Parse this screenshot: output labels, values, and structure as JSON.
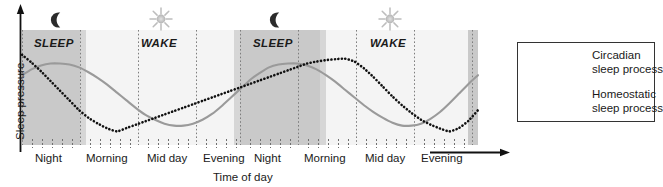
{
  "chart_data": {
    "type": "line",
    "title": "",
    "xlabel": "Time of day",
    "ylabel": "Sleep pressure",
    "grid": true,
    "legend_position": "right",
    "xlim": [
      0,
      48
    ],
    "ylim": [
      0,
      1
    ],
    "x_tick_labels": [
      "Night",
      "Morning",
      "Mid day",
      "Evening",
      "Night",
      "Morning",
      "Mid day",
      "Evening"
    ],
    "y_tick_labels": [],
    "annotations": [
      "SLEEP",
      "WAKE",
      "SLEEP",
      "WAKE"
    ],
    "shaded_regions": [
      {
        "label": "SLEEP",
        "x0": 0,
        "x1": 6,
        "color": "#c9c9c9"
      },
      {
        "label": "WAKE",
        "x0": 6,
        "x1": 24,
        "color": "#f2f2f2"
      },
      {
        "label": "SLEEP",
        "x0": 24,
        "x1": 30,
        "color": "#c9c9c9"
      },
      {
        "label": "WAKE",
        "x0": 30,
        "x1": 48,
        "color": "#f2f2f2"
      }
    ],
    "series": [
      {
        "name": "Circadian sleep process",
        "style": "solid",
        "color": "#9a9a9a",
        "x": [
          0,
          1,
          2,
          3,
          4,
          5,
          6,
          7,
          8,
          9,
          10,
          11,
          12,
          13,
          14,
          15,
          16,
          17,
          18,
          19,
          20,
          21,
          22,
          23,
          24,
          25,
          26,
          27,
          28,
          29,
          30,
          31,
          32,
          33,
          34,
          35,
          36,
          37,
          38,
          39,
          40,
          41,
          42,
          43,
          44,
          45,
          46,
          47,
          48
        ],
        "y": [
          0.72,
          0.78,
          0.82,
          0.84,
          0.84,
          0.83,
          0.8,
          0.75,
          0.69,
          0.62,
          0.54,
          0.46,
          0.38,
          0.31,
          0.26,
          0.22,
          0.2,
          0.2,
          0.22,
          0.26,
          0.32,
          0.4,
          0.49,
          0.58,
          0.67,
          0.74,
          0.8,
          0.83,
          0.84,
          0.84,
          0.82,
          0.78,
          0.72,
          0.65,
          0.57,
          0.49,
          0.41,
          0.34,
          0.28,
          0.23,
          0.2,
          0.2,
          0.22,
          0.27,
          0.34,
          0.43,
          0.53,
          0.63,
          0.72
        ]
      },
      {
        "name": "Homeostatic sleep process",
        "style": "dotted",
        "color": "#111111",
        "x": [
          0,
          1,
          2,
          3,
          4,
          5,
          6,
          7,
          8,
          9,
          10,
          11,
          12,
          13,
          14,
          15,
          16,
          17,
          18,
          19,
          20,
          21,
          22,
          23,
          24,
          25,
          26,
          27,
          28,
          29,
          30,
          31,
          32,
          33,
          34,
          35,
          36,
          37,
          38,
          39,
          40,
          41,
          42,
          43,
          44,
          45,
          46,
          47,
          48
        ],
        "y": [
          0.93,
          0.85,
          0.76,
          0.66,
          0.56,
          0.46,
          0.36,
          0.28,
          0.22,
          0.17,
          0.14,
          0.175,
          0.21,
          0.245,
          0.28,
          0.315,
          0.35,
          0.385,
          0.42,
          0.455,
          0.49,
          0.525,
          0.56,
          0.595,
          0.63,
          0.665,
          0.7,
          0.735,
          0.77,
          0.805,
          0.84,
          0.86,
          0.875,
          0.885,
          0.89,
          0.86,
          0.79,
          0.7,
          0.6,
          0.5,
          0.41,
          0.33,
          0.26,
          0.21,
          0.17,
          0.14,
          0.175,
          0.25,
          0.36
        ]
      }
    ]
  },
  "axes": {
    "ylabel": "Sleep pressure",
    "xlabel": "Time of day",
    "x_ticks": [
      "Night",
      "Morning",
      "Mid day",
      "Evening",
      "Night",
      "Morning",
      "Mid day",
      "Evening"
    ]
  },
  "phase_labels": [
    {
      "text": "SLEEP",
      "icon": "moon-icon"
    },
    {
      "text": "WAKE",
      "icon": "sun-icon"
    },
    {
      "text": "SLEEP",
      "icon": "moon-icon"
    },
    {
      "text": "WAKE",
      "icon": "sun-icon"
    }
  ],
  "legend": {
    "items": [
      {
        "label_line1": "Circadian",
        "label_line2": "sleep process",
        "style": "solid",
        "color": "#9a9a9a"
      },
      {
        "label_line1": "Homeostatic",
        "label_line2": "sleep process",
        "style": "dotted",
        "color": "#111111"
      }
    ]
  },
  "colors": {
    "sleep_band": "#c9c9c9",
    "sleep_band_edge": "#d8d8d8",
    "wake_band": "#f2f2f2",
    "circadian": "#9a9a9a",
    "homeostatic": "#111111",
    "axis": "#1a1a1a",
    "gridline": "#8a8a8a"
  }
}
